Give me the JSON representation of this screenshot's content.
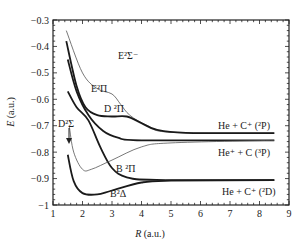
{
  "chart_data": {
    "type": "line",
    "title": "",
    "xlabel": "R (a.u.)",
    "ylabel": "E (a.u.)",
    "xlim": [
      1,
      9
    ],
    "ylim": [
      -1,
      -0.3
    ],
    "xticks": [
      "1",
      "2",
      "3",
      "4",
      "5",
      "6",
      "7",
      "8",
      "9"
    ],
    "yticks": [
      "-0.3",
      "-0.4",
      "-0.5",
      "-0.6",
      "-0.7",
      "-0.8",
      "-0.9",
      "-1"
    ],
    "grid": false,
    "legend": "none (inline curve labels)",
    "series": [
      {
        "name": "E 2Σ-",
        "style": "thin",
        "x": [
          1.45,
          2.0,
          2.5,
          3.0,
          3.3,
          3.6,
          4.2,
          5.0,
          8.5
        ],
        "y": [
          -0.34,
          -0.5,
          -0.56,
          -0.58,
          -0.62,
          -0.66,
          -0.7,
          -0.725,
          -0.728
        ]
      },
      {
        "name": "E 2Π",
        "style": "thick",
        "x": [
          1.45,
          1.8,
          2.1,
          2.5,
          3.0,
          3.5,
          4.0,
          4.5,
          5.5,
          8.5
        ],
        "y": [
          -0.38,
          -0.55,
          -0.63,
          -0.66,
          -0.665,
          -0.665,
          -0.69,
          -0.715,
          -0.727,
          -0.728
        ]
      },
      {
        "name": "D 2Π",
        "style": "thick",
        "x": [
          1.5,
          1.8,
          2.2,
          2.7,
          3.2,
          4.0,
          8.5
        ],
        "y": [
          -0.45,
          -0.57,
          -0.66,
          -0.72,
          -0.745,
          -0.755,
          -0.755
        ]
      },
      {
        "name": "D 2Σ",
        "style": "thick",
        "x": [
          1.5,
          1.8,
          2.2,
          2.6,
          3.0,
          3.5,
          4.5,
          8.5
        ],
        "y": [
          -0.57,
          -0.63,
          -0.68,
          -0.78,
          -0.86,
          -0.895,
          -0.905,
          -0.906
        ]
      },
      {
        "name": "B 2Π",
        "style": "thin",
        "x": [
          1.55,
          1.7,
          2.0,
          2.3,
          3.0,
          4.0,
          5.0,
          8.5
        ],
        "y": [
          -0.7,
          -0.8,
          -0.865,
          -0.865,
          -0.83,
          -0.78,
          -0.765,
          -0.755
        ]
      },
      {
        "name": "B 2Δ",
        "style": "thick",
        "x": [
          1.5,
          1.7,
          2.0,
          2.5,
          3.0,
          4.0,
          5.0,
          8.5
        ],
        "y": [
          -0.81,
          -0.91,
          -0.955,
          -0.96,
          -0.945,
          -0.915,
          -0.908,
          -0.906
        ]
      }
    ],
    "annotations": [
      {
        "text": "E²Σ⁻",
        "x": 2.75,
        "y": -0.52
      },
      {
        "text": "E²Π",
        "x": 2.4,
        "y": -0.645
      },
      {
        "text": "D ²Π",
        "x": 2.7,
        "y": -0.71
      },
      {
        "text": "D²Σ",
        "x": 1.05,
        "y": -0.69,
        "arrow_to": [
          1.5,
          -0.74
        ]
      },
      {
        "text": "B ²Π",
        "x": 3.0,
        "y": -0.855
      },
      {
        "text": "B²Δ",
        "x": 3.0,
        "y": -0.94
      },
      {
        "text": "He + C⁺ (²P)",
        "x": 6.6,
        "y": -0.72
      },
      {
        "text": "He⁺ + C (³P)",
        "x": 6.6,
        "y": -0.785
      },
      {
        "text": "He + C⁺ (²D)",
        "x": 6.8,
        "y": -0.93
      }
    ],
    "asymptotes": [
      {
        "label": "He + C⁺ (²P)",
        "E": -0.728
      },
      {
        "label": "He⁺ + C (³P)",
        "E": -0.755
      },
      {
        "label": "He + C⁺ (²D)",
        "E": -0.906
      }
    ]
  },
  "labels": {
    "xlabel_italic": "R",
    "xlabel_unit": " (a.u.)",
    "ylabel_italic": "E",
    "ylabel_unit": " (a.u.)",
    "e2sigma_minus": "E²Σ⁻",
    "e2pi": "E²Π",
    "d2pi": "D ²Π",
    "d2sigma": "D²Σ",
    "b2pi": "B ²Π",
    "b2delta": "B²Δ",
    "asym_2p": "He + C⁺ (²P)",
    "asym_3p": "He⁺ + C (³P)",
    "asym_2d": "He + C⁺ (²D)"
  }
}
